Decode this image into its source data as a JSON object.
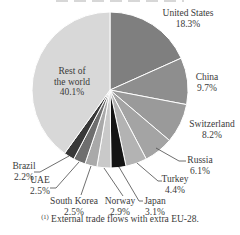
{
  "chart_data": {
    "type": "pie",
    "unit": "%",
    "start_angle_deg": 0,
    "direction": "clockwise",
    "slices": [
      {
        "name": "United States",
        "value": 18.3,
        "pct": "18.3%",
        "color": "#7f7f7f"
      },
      {
        "name": "China",
        "value": 9.7,
        "pct": "9.7%",
        "color": "#8e8e8e"
      },
      {
        "name": "Switzerland",
        "value": 8.2,
        "pct": "8.2%",
        "color": "#9a9a9a"
      },
      {
        "name": "Russia",
        "value": 6.1,
        "pct": "6.1%",
        "color": "#a4a4a4"
      },
      {
        "name": "Turkey",
        "value": 4.4,
        "pct": "4.4%",
        "color": "#b3b3b3"
      },
      {
        "name": "Japan",
        "value": 3.1,
        "pct": "3.1%",
        "color": "#141414"
      },
      {
        "name": "Norway",
        "value": 2.9,
        "pct": "2.9%",
        "color": "#c9c9c9"
      },
      {
        "name": "South Korea",
        "value": 2.5,
        "pct": "2.5%",
        "color": "#a9a9a9"
      },
      {
        "name": "UAE",
        "value": 2.5,
        "pct": "2.5%",
        "color": "#6e6e6e"
      },
      {
        "name": "Brazil",
        "value": 2.2,
        "pct": "2.2%",
        "color": "#383838"
      },
      {
        "name": "Rest of the world",
        "value": 40.1,
        "pct": "40.1%",
        "color": "#d8d8d8",
        "display_lines": [
          "Rest of",
          "the world"
        ]
      }
    ],
    "footnote_marker": "(1)",
    "footnote_text": "External trade flows with extra EU-28."
  }
}
